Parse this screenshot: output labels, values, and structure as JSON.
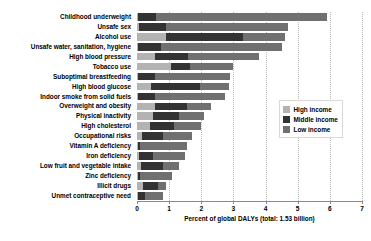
{
  "chart_data": {
    "type": "bar",
    "orientation": "horizontal",
    "stacked": true,
    "title": "",
    "xlabel": "Percent of global DALYs (total: 1.53 billion)",
    "ylabel": "",
    "xlim": [
      0,
      7
    ],
    "xticks": [
      "0",
      "1",
      "2",
      "3",
      "4",
      "5",
      "6",
      "7"
    ],
    "xtick_values": [
      0,
      1,
      2,
      3,
      4,
      5,
      6,
      7
    ],
    "grid": "vertical dotted gridlines at each integer tick",
    "legend_position": "center-right inside plot area",
    "categories": [
      "Childhood underweight",
      "Unsafe sex",
      "Alcohol use",
      "Unsafe water, sanitation, hygiene",
      "High blood pressure",
      "Tobacco use",
      "Suboptimal breastfeeding",
      "High blood glucose",
      "Indoor smoke from solid fuels",
      "Overweight and obesity",
      "Physical inactivity",
      "High cholesterol",
      "Occupational risks",
      "Vitamin A deficiency",
      "Iron deficiency",
      "Low fruit and vegetable intake",
      "Zinc deficiency",
      "Illicit drugs",
      "Unmet contraceptive need"
    ],
    "series": [
      {
        "name": "High income",
        "color": "#b3b3b3",
        "values": [
          0.02,
          0.05,
          0.9,
          0.02,
          0.55,
          1.05,
          0.02,
          0.45,
          0.02,
          0.55,
          0.5,
          0.4,
          0.15,
          0.02,
          0.05,
          0.12,
          0.02,
          0.2,
          0.02
        ]
      },
      {
        "name": "Middle income",
        "color": "#333333",
        "values": [
          0.58,
          0.85,
          2.4,
          0.73,
          1.05,
          0.6,
          0.53,
          1.5,
          0.53,
          1.0,
          0.8,
          0.75,
          0.65,
          0.08,
          0.45,
          0.68,
          0.08,
          0.45,
          0.23
        ]
      },
      {
        "name": "Low income",
        "color": "#707070",
        "values": [
          5.3,
          3.8,
          1.3,
          3.75,
          2.2,
          1.35,
          2.35,
          0.9,
          2.2,
          0.75,
          0.8,
          0.85,
          0.9,
          1.45,
          1.0,
          0.5,
          1.0,
          0.25,
          0.55
        ]
      }
    ],
    "totals": [
      5.9,
      4.7,
      4.6,
      4.5,
      3.8,
      3.0,
      2.9,
      2.85,
      2.75,
      2.3,
      2.1,
      2.0,
      1.7,
      1.55,
      1.5,
      1.3,
      1.1,
      0.9,
      0.8
    ]
  },
  "axis": {
    "x_title": "Percent of global DALYs (total: 1.53 billion)",
    "ticks": [
      "0",
      "1",
      "2",
      "3",
      "4",
      "5",
      "6",
      "7"
    ]
  },
  "legend": {
    "items": [
      {
        "label": "High income",
        "color": "#b3b3b3"
      },
      {
        "label": "Middle income",
        "color": "#333333"
      },
      {
        "label": "Low income",
        "color": "#707070"
      }
    ]
  }
}
